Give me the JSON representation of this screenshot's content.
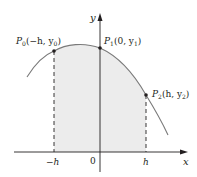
{
  "figure": {
    "type": "Simpson's rule parabola through three points",
    "colors": {
      "curve": "#7a7a7a",
      "axis": "#231f20",
      "shade": "#ececec",
      "point": "#231f20",
      "dash": "#231f20"
    },
    "axes": {
      "x_label": "x",
      "y_label": "y",
      "origin_label": "0"
    },
    "ticks": [
      {
        "label": "−h",
        "x": 53
      },
      {
        "label": "h",
        "x": 146
      }
    ],
    "points": [
      {
        "name": "P",
        "sub": "0",
        "coords": "(−h, y",
        "coord_sub": "0",
        "close": ")",
        "x": 54,
        "y": 51
      },
      {
        "name": "P",
        "sub": "1",
        "coords": "(0, y",
        "coord_sub": "1",
        "close": ")",
        "x": 100,
        "y": 48
      },
      {
        "name": "P",
        "sub": "2",
        "coords": "(h, y",
        "coord_sub": "2",
        "close": ")",
        "x": 146,
        "y": 95
      }
    ]
  }
}
